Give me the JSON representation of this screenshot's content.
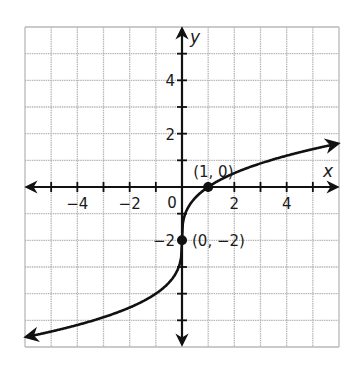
{
  "chart_data": {
    "type": "line",
    "title": "",
    "xlabel": "x",
    "ylabel": "y",
    "xlim": [
      -6,
      6
    ],
    "ylim": [
      -6,
      6
    ],
    "grid": true,
    "grid_step": 1,
    "x_ticks": [
      -4,
      -2,
      0,
      2,
      4
    ],
    "x_tick_labels": [
      "−4",
      "−2",
      "0",
      "2",
      "4"
    ],
    "y_ticks": [
      -2,
      2,
      4
    ],
    "y_tick_labels": [
      "−2",
      "2",
      "4"
    ],
    "origin_label": "0",
    "function": "y = 2·∛x − 2",
    "series": [
      {
        "name": "curve",
        "x": [
          -6,
          -5,
          -4,
          -3,
          -2,
          -1,
          -0.5,
          -0.1,
          0,
          0.1,
          0.5,
          1,
          2,
          3,
          4,
          5,
          6
        ],
        "values": [
          -5.63,
          -5.42,
          -5.17,
          -4.88,
          -4.52,
          -4.0,
          -3.59,
          -2.93,
          -2.0,
          -1.07,
          -0.41,
          0.0,
          0.52,
          0.88,
          1.17,
          1.42,
          1.63
        ]
      }
    ],
    "points": [
      {
        "x": 1,
        "y": 0,
        "label": "(1, 0)"
      },
      {
        "x": 0,
        "y": -2,
        "label": "(0, −2)"
      }
    ],
    "annotations": [
      "(1, 0)",
      "(0, −2)"
    ]
  },
  "colors": {
    "grid": "#b8b8b8",
    "axis": "#1a1a1a",
    "curve": "#111111"
  }
}
